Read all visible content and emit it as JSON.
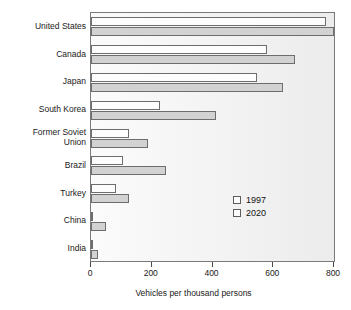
{
  "chart_data": {
    "type": "bar",
    "orientation": "horizontal",
    "title": "",
    "xlabel": "Vehicles per thousand persons",
    "ylabel": "",
    "xlim": [
      0,
      800
    ],
    "xticks": [
      0,
      200,
      400,
      600,
      800
    ],
    "xtick_labels": [
      "0",
      "200",
      "400",
      "600",
      "800"
    ],
    "grid": false,
    "legend_position": "inside-lower-right",
    "categories": [
      "United States",
      "Canada",
      "Japan",
      "South Korea",
      "Former Soviet\nUnion",
      "Brazil",
      "Turkey",
      "China",
      "India"
    ],
    "series": [
      {
        "name": "1997",
        "color": "#fdfdfd",
        "values": [
          775,
          580,
          545,
          228,
          125,
          105,
          82,
          8,
          5
        ]
      },
      {
        "name": "2020",
        "color": "#d2d2d2",
        "values": [
          800,
          672,
          632,
          412,
          188,
          248,
          125,
          50,
          22
        ]
      }
    ]
  },
  "legend": {
    "items": [
      {
        "label": "1997"
      },
      {
        "label": "2020"
      }
    ]
  },
  "axis": {
    "x_title": "Vehicles per thousand persons"
  }
}
